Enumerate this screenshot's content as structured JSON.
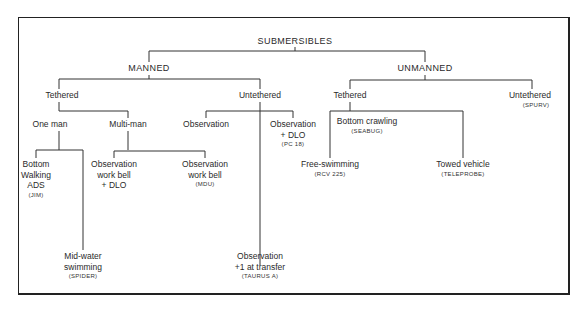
{
  "diagram": {
    "type": "tree",
    "root": {
      "label": "SUBMERSIBLES",
      "children": [
        {
          "label": "MANNED",
          "children": [
            {
              "label": "Tethered",
              "children": [
                {
                  "label": "One man",
                  "children": [
                    {
                      "label": "Bottom Walking ADS",
                      "example": "(JIM)"
                    },
                    {
                      "label": "Mid-water swimming",
                      "example": "(SPIDER)"
                    }
                  ]
                },
                {
                  "label": "Multi-man",
                  "children": [
                    {
                      "label": "Observation work bell + DLO",
                      "example": ""
                    },
                    {
                      "label": "Observation work bell",
                      "example": "(MDU)"
                    }
                  ]
                }
              ]
            },
            {
              "label": "Untethered",
              "children": [
                {
                  "label": "Observation",
                  "example": ""
                },
                {
                  "label": "Observation + DLO",
                  "example": "(PC 18)"
                },
                {
                  "label": "Observation +1 at transfer",
                  "example": "(TAURUS A)"
                }
              ]
            }
          ]
        },
        {
          "label": "UNMANNED",
          "children": [
            {
              "label": "Tethered",
              "children": [
                {
                  "label": "Bottom crawling",
                  "example": "(SEABUG)"
                },
                {
                  "label": "Free-swimming",
                  "example": "(RCV 225)"
                },
                {
                  "label": "Towed vehicle",
                  "example": "(TELEPROBE)"
                }
              ]
            },
            {
              "label": "Untethered",
              "example": "(SPURV)"
            }
          ]
        }
      ]
    }
  },
  "labels": {
    "root": "SUBMERSIBLES",
    "manned": "MANNED",
    "unmanned": "UNMANNED",
    "m_tethered": "Tethered",
    "m_untethered": "Untethered",
    "one_man": "One man",
    "multi_man": "Multi-man",
    "observation": "Observation",
    "obs_dlo_1": "Observation",
    "obs_dlo_2": "+ DLO",
    "obs_dlo_ex": "(PC 18)",
    "bw_1": "Bottom",
    "bw_2": "Walking",
    "bw_3": "ADS",
    "bw_ex": "(JIM)",
    "mw_1": "Mid-water",
    "mw_2": "swimming",
    "mw_ex": "(SPIDER)",
    "owb_dlo_1": "Observation",
    "owb_dlo_2": "work bell",
    "owb_dlo_3": "+ DLO",
    "owb_1": "Observation",
    "owb_2": "work bell",
    "owb_ex": "(MDU)",
    "obs_t_1": "Observation",
    "obs_t_2": "+1 at transfer",
    "obs_t_ex": "(TAURUS A)",
    "u_tethered": "Tethered",
    "u_untethered": "Untethered",
    "u_untethered_ex": "(SPURV)",
    "bc": "Bottom crawling",
    "bc_ex": "(SEABUG)",
    "fs": "Free-swimming",
    "fs_ex": "(RCV 225)",
    "tv": "Towed vehicle",
    "tv_ex": "(TELEPROBE)"
  }
}
